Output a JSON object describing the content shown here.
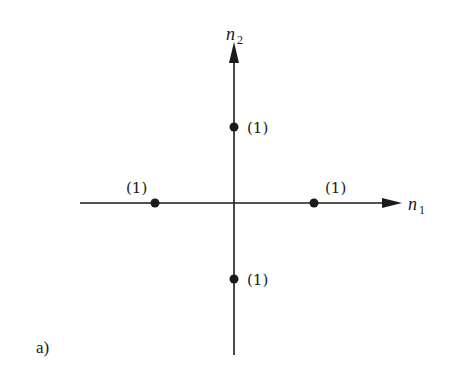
{
  "panel_label": "a)",
  "axes": {
    "horizontal": {
      "name": "n",
      "subscript": "1"
    },
    "vertical": {
      "name": "n",
      "subscript": "2"
    }
  },
  "points": [
    {
      "n1": 0,
      "n2": 1,
      "value": "(1)"
    },
    {
      "n1": 1,
      "n2": 0,
      "value": "(1)"
    },
    {
      "n1": -1,
      "n2": 0,
      "value": "(1)"
    },
    {
      "n1": 0,
      "n2": -1,
      "value": "(1)"
    }
  ],
  "colors": {
    "ink": "#1a1a1a",
    "background": "#ffffff"
  }
}
